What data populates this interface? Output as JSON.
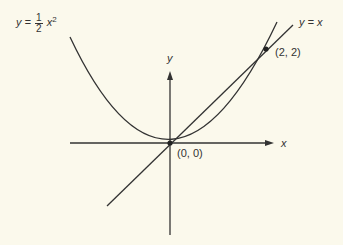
{
  "diagram": {
    "axes": {
      "x_label": "x",
      "y_label": "y"
    },
    "curves": [
      {
        "name": "parabola",
        "label_lhs": "y =",
        "label_num": "1",
        "label_den": "2",
        "label_rhs": "x",
        "label_exp": "2"
      },
      {
        "name": "line",
        "label": "y = x"
      }
    ],
    "points": [
      {
        "label": "(0, 0)",
        "x": 0,
        "y": 0
      },
      {
        "label": "(2, 2)",
        "x": 2,
        "y": 2
      }
    ],
    "colors": {
      "background": "#fbf9ec",
      "ink": "#333333"
    }
  }
}
